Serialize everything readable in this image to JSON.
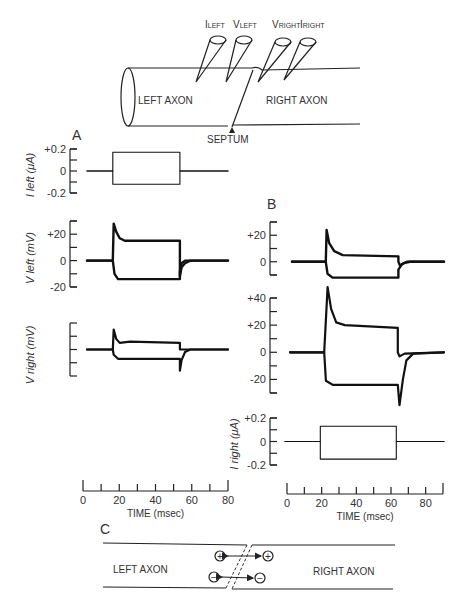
{
  "schematic": {
    "electrodes": [
      "I_LEFT",
      "V_LEFT",
      "V_RIGHT",
      "I_RIGHT"
    ],
    "electrode_labels": [
      {
        "main": "I",
        "sub": "LEFT"
      },
      {
        "main": "V",
        "sub": "LEFT"
      },
      {
        "main": "V",
        "sub": "RIGHT"
      },
      {
        "main": "I",
        "sub": "RIGHT"
      }
    ],
    "left_label": "LEFT AXON",
    "right_label": "RIGHT AXON",
    "septum_label": "SEPTUM"
  },
  "panels": {
    "A": "A",
    "B": "B",
    "C": "C"
  },
  "chart_data": [
    {
      "id": "A-I-left",
      "type": "line",
      "panel": "A",
      "ylabel": "I left (μA)",
      "ylim": [
        -0.2,
        0.2
      ],
      "yticks": [
        "+0.2",
        "0",
        "-0.2"
      ],
      "series": [
        {
          "name": "depolarizing",
          "points": [
            [
              0,
              0
            ],
            [
              15,
              0
            ],
            [
              15,
              0.17
            ],
            [
              54,
              0.17
            ],
            [
              54,
              0
            ],
            [
              82,
              0
            ]
          ]
        },
        {
          "name": "hyperpolarizing",
          "points": [
            [
              0,
              0
            ],
            [
              15,
              0
            ],
            [
              15,
              -0.12
            ],
            [
              54,
              -0.12
            ],
            [
              54,
              0
            ],
            [
              82,
              0
            ]
          ]
        }
      ]
    },
    {
      "id": "A-V-left",
      "type": "line",
      "panel": "A",
      "ylabel": "V left (mV)",
      "ylim": [
        -20,
        30
      ],
      "yticks": [
        "+20",
        "0",
        "-20"
      ],
      "series": [
        {
          "name": "depolarizing",
          "points": [
            [
              0,
              0
            ],
            [
              15,
              0
            ],
            [
              15.5,
              28
            ],
            [
              17,
              22
            ],
            [
              19,
              17
            ],
            [
              22,
              15
            ],
            [
              30,
              15
            ],
            [
              54,
              15
            ],
            [
              54,
              -12
            ],
            [
              55,
              -5
            ],
            [
              57,
              -2
            ],
            [
              60,
              0
            ],
            [
              82,
              0
            ]
          ]
        },
        {
          "name": "hyperpolarizing",
          "points": [
            [
              0,
              0
            ],
            [
              15,
              0
            ],
            [
              16,
              -10
            ],
            [
              18,
              -14
            ],
            [
              22,
              -14
            ],
            [
              54,
              -14
            ],
            [
              54,
              -8
            ],
            [
              55,
              -2
            ],
            [
              57,
              0
            ],
            [
              82,
              0
            ]
          ]
        }
      ]
    },
    {
      "id": "A-V-right",
      "type": "line",
      "panel": "A",
      "ylabel": "V right (mV)",
      "ylim": [
        -20,
        20
      ],
      "yticks": [
        "",
        "",
        "",
        "",
        ""
      ],
      "series": [
        {
          "name": "depolarizing",
          "points": [
            [
              0,
              0
            ],
            [
              15,
              0
            ],
            [
              15.5,
              15
            ],
            [
              17,
              8
            ],
            [
              19,
              5
            ],
            [
              25,
              6
            ],
            [
              54,
              5
            ],
            [
              54,
              0
            ],
            [
              56,
              0
            ],
            [
              82,
              0
            ]
          ]
        },
        {
          "name": "hyperpolarizing",
          "points": [
            [
              0,
              0
            ],
            [
              15,
              0
            ],
            [
              15.5,
              -4
            ],
            [
              18,
              -7
            ],
            [
              54,
              -7
            ],
            [
              54,
              -16
            ],
            [
              55,
              -8
            ],
            [
              57,
              -2
            ],
            [
              60,
              0
            ],
            [
              82,
              0
            ]
          ]
        }
      ]
    },
    {
      "id": "A-time",
      "type": "axis",
      "panel": "A",
      "xlabel": "TIME (msec)",
      "xlim": [
        0,
        80
      ],
      "xticks": [
        "0",
        "20",
        "40",
        "60",
        "80"
      ]
    },
    {
      "id": "B-V-left",
      "type": "line",
      "panel": "B",
      "ylabel": "",
      "ylim": [
        -10,
        30
      ],
      "yticks": [
        "+20",
        "0"
      ],
      "series": [
        {
          "name": "depolarizing",
          "points": [
            [
              0,
              0
            ],
            [
              20,
              0
            ],
            [
              20.5,
              24
            ],
            [
              22,
              14
            ],
            [
              25,
              8
            ],
            [
              30,
              5
            ],
            [
              63,
              4
            ],
            [
              63,
              0
            ],
            [
              64,
              -3
            ],
            [
              66,
              -1
            ],
            [
              70,
              0
            ],
            [
              90,
              0
            ]
          ]
        },
        {
          "name": "hyperpolarizing",
          "points": [
            [
              0,
              0
            ],
            [
              20,
              0
            ],
            [
              21,
              -9
            ],
            [
              24,
              -12
            ],
            [
              63,
              -12
            ],
            [
              63,
              -6
            ],
            [
              65,
              -2
            ],
            [
              68,
              0
            ],
            [
              90,
              0
            ]
          ]
        }
      ]
    },
    {
      "id": "B-V-right",
      "type": "line",
      "panel": "B",
      "ylabel": "",
      "ylim": [
        -30,
        40
      ],
      "yticks": [
        "+40",
        "+20",
        "0",
        "-20"
      ],
      "series": [
        {
          "name": "depolarizing",
          "points": [
            [
              0,
              0
            ],
            [
              20,
              0
            ],
            [
              22,
              48
            ],
            [
              24,
              32
            ],
            [
              27,
              22
            ],
            [
              32,
              20
            ],
            [
              63,
              18
            ],
            [
              63,
              15
            ],
            [
              63,
              0
            ],
            [
              64,
              -3
            ],
            [
              67,
              -1
            ],
            [
              90,
              0
            ]
          ]
        },
        {
          "name": "hyperpolarizing",
          "points": [
            [
              0,
              0
            ],
            [
              20,
              0
            ],
            [
              21,
              -21
            ],
            [
              25,
              -24
            ],
            [
              63,
              -24
            ],
            [
              64,
              -39
            ],
            [
              66,
              -20
            ],
            [
              68,
              -6
            ],
            [
              72,
              -1
            ],
            [
              90,
              0
            ]
          ]
        }
      ]
    },
    {
      "id": "B-I-right",
      "type": "line",
      "panel": "B",
      "ylabel": "I right (μA)",
      "ylim": [
        -0.2,
        0.2
      ],
      "yticks": [
        "+0.2",
        "0",
        "-0.2"
      ],
      "series": [
        {
          "name": "depolarizing",
          "points": [
            [
              0,
              0
            ],
            [
              20,
              0
            ],
            [
              20,
              0.13
            ],
            [
              63,
              0.13
            ],
            [
              63,
              0
            ],
            [
              90,
              0
            ]
          ]
        },
        {
          "name": "hyperpolarizing",
          "points": [
            [
              0,
              0
            ],
            [
              20,
              0
            ],
            [
              20,
              -0.15
            ],
            [
              63,
              -0.15
            ],
            [
              63,
              0
            ],
            [
              90,
              0
            ]
          ]
        }
      ]
    },
    {
      "id": "B-time",
      "type": "axis",
      "panel": "B",
      "xlabel": "TIME (msec)",
      "xlim": [
        0,
        90
      ],
      "xticks": [
        "0",
        "20",
        "40",
        "60",
        "80"
      ]
    }
  ],
  "diagramC": {
    "left_label": "LEFT AXON",
    "right_label": "RIGHT AXON",
    "plus": "+",
    "minus": "−"
  }
}
